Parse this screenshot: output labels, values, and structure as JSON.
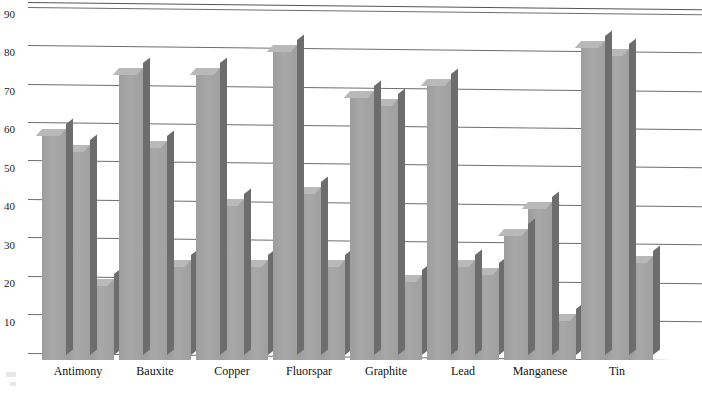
{
  "chart_data": {
    "type": "bar",
    "title": "",
    "subtitle": "",
    "xlabel": "",
    "ylabel": "",
    "categories": [
      "Antimony",
      "Bauxite",
      "Copper",
      "Fluorspar",
      "Graphite",
      "Lead",
      "Manganese",
      "Tin"
    ],
    "series": [
      {
        "name": "Series 1",
        "values": [
          60,
          76,
          76,
          82,
          70,
          73,
          34,
          83
        ]
      },
      {
        "name": "Series 2",
        "values": [
          56,
          57,
          42,
          45,
          68,
          26,
          41,
          81
        ]
      },
      {
        "name": "Series 3",
        "values": [
          21,
          26,
          26,
          26,
          22,
          24,
          12,
          27
        ]
      }
    ],
    "ylim": [
      0,
      90
    ],
    "yticks": [
      10,
      20,
      30,
      40,
      50,
      60,
      70,
      80,
      90
    ],
    "ytick_labels": [
      "10",
      "20",
      "30",
      "40",
      "50",
      "60",
      "70",
      "80",
      "90"
    ],
    "grid": true,
    "grid_axis": "y",
    "legend": false,
    "legend_position": "none",
    "style": "3d-grayscale",
    "colors": {
      "bar_front": "#a3a3a3",
      "bar_top": "#b9b9b9",
      "bar_side": "#6d6d6d",
      "gridline": "#6e6e6e",
      "text": "#111111",
      "background": "#ffffff"
    }
  },
  "axis": {
    "y_tick_0": "10",
    "y_tick_1": "20",
    "y_tick_2": "30",
    "y_tick_3": "40",
    "y_tick_4": "50",
    "y_tick_5": "60",
    "y_tick_6": "70",
    "y_tick_7": "80",
    "y_tick_8": "90"
  },
  "categories": {
    "c0": "Antimony",
    "c1": "Bauxite",
    "c2": "Copper",
    "c3": "Fluorspar",
    "c4": "Graphite",
    "c5": "Lead",
    "c6": "Manganese",
    "c7": "Tin"
  }
}
